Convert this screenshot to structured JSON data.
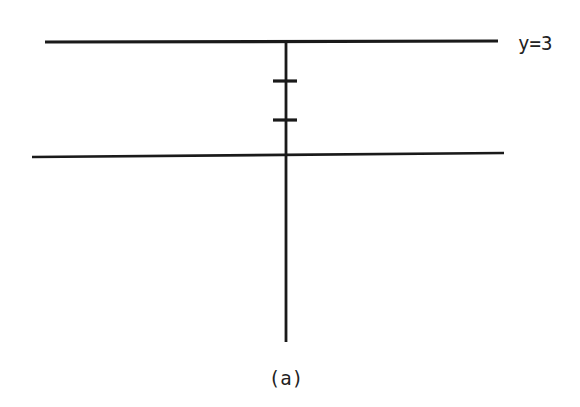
{
  "figure": {
    "caption": "(a)",
    "line_label": "y=3",
    "stroke_color": "#1a1a1a",
    "background": "#ffffff",
    "elements": {
      "top_line": {
        "x1": 45,
        "y1": 42,
        "x2": 498,
        "y2": 41,
        "label": "y=3"
      },
      "bottom_line": {
        "x1": 32,
        "y1": 157,
        "x2": 504,
        "y2": 153
      },
      "vertical_line": {
        "x1": 286,
        "y1": 42,
        "x2": 286,
        "y2": 342
      },
      "ticks": [
        {
          "y": 81,
          "x1": 273,
          "x2": 297
        },
        {
          "y": 120,
          "x1": 273,
          "x2": 297
        }
      ]
    }
  }
}
